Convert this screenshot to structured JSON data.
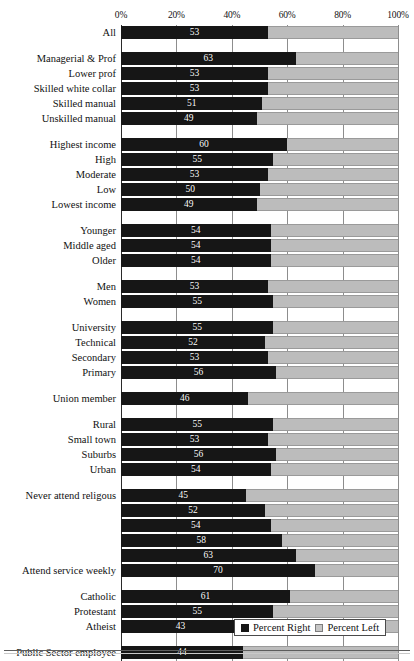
{
  "chart_data": {
    "type": "bar",
    "orientation": "horizontal",
    "stacked": true,
    "title": "",
    "xlabel": "",
    "ylabel": "",
    "xlim": [
      0,
      100
    ],
    "grid": true,
    "legend_position": "bottom-right",
    "tick_labels": [
      "0%",
      "20%",
      "40%",
      "60%",
      "80%",
      "100%"
    ],
    "tick_values": [
      0,
      20,
      40,
      60,
      80,
      100
    ],
    "series": [
      {
        "name": "Percent Right",
        "color": "#161616"
      },
      {
        "name": "Percent Left",
        "color": "#bcbcbc"
      }
    ],
    "groups": [
      {
        "name": "overall",
        "rows": [
          {
            "label": "All",
            "value": 53
          }
        ]
      },
      {
        "name": "occupation",
        "rows": [
          {
            "label": "Managerial & Prof",
            "value": 63
          },
          {
            "label": "Lower prof",
            "value": 53
          },
          {
            "label": "Skilled white collar",
            "value": 53
          },
          {
            "label": "Skilled manual",
            "value": 51
          },
          {
            "label": "Unskilled manual",
            "value": 49
          }
        ]
      },
      {
        "name": "income",
        "rows": [
          {
            "label": "Highest income",
            "value": 60
          },
          {
            "label": "High",
            "value": 55
          },
          {
            "label": "Moderate",
            "value": 53
          },
          {
            "label": "Low",
            "value": 50
          },
          {
            "label": "Lowest income",
            "value": 49
          }
        ]
      },
      {
        "name": "age",
        "rows": [
          {
            "label": "Younger",
            "value": 54
          },
          {
            "label": "Middle aged",
            "value": 54
          },
          {
            "label": "Older",
            "value": 54
          }
        ]
      },
      {
        "name": "gender",
        "rows": [
          {
            "label": "Men",
            "value": 53
          },
          {
            "label": "Women",
            "value": 55
          }
        ]
      },
      {
        "name": "education",
        "rows": [
          {
            "label": "University",
            "value": 55
          },
          {
            "label": "Technical",
            "value": 52
          },
          {
            "label": "Secondary",
            "value": 53
          },
          {
            "label": "Primary",
            "value": 56
          }
        ]
      },
      {
        "name": "union",
        "rows": [
          {
            "label": "Union member",
            "value": 46
          }
        ]
      },
      {
        "name": "settlement",
        "rows": [
          {
            "label": "Rural",
            "value": 55
          },
          {
            "label": "Small town",
            "value": 53
          },
          {
            "label": "Suburbs",
            "value": 56
          },
          {
            "label": "Urban",
            "value": 54
          }
        ]
      },
      {
        "name": "religious-attendance",
        "rows": [
          {
            "label": "Never attend religous",
            "value": 45
          },
          {
            "label": "",
            "value": 52
          },
          {
            "label": "",
            "value": 54
          },
          {
            "label": "",
            "value": 58
          },
          {
            "label": "",
            "value": 63
          },
          {
            "label": "Attend service weekly",
            "value": 70
          }
        ]
      },
      {
        "name": "denomination",
        "rows": [
          {
            "label": "Catholic",
            "value": 61
          },
          {
            "label": "Protestant",
            "value": 55
          },
          {
            "label": "Atheist",
            "value": 43
          }
        ]
      },
      {
        "name": "employment-sector",
        "rows": [
          {
            "label": "Public Sector employee",
            "value": 44
          },
          {
            "label": "Private sector",
            "value": 50
          },
          {
            "label": "Self-employed",
            "value": 68
          }
        ]
      }
    ]
  },
  "legend": {
    "right_label": "Percent Right",
    "left_label": "Percent Left"
  }
}
